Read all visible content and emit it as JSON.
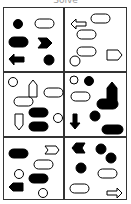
{
  "title": "Solve",
  "panels": [
    {
      "id": "top-left",
      "shapes": [
        "filled-circle",
        "outlined-rounded-rect",
        "filled-rounded-rect",
        "filled-chevron",
        "filled-arrow-left",
        "filled-circle"
      ]
    },
    {
      "id": "top-right",
      "shapes": [
        "outlined-arrow-left",
        "outlined-rounded-rect",
        "outlined-rounded-rect",
        "outlined-rounded-rect",
        "outlined-pentagon-right",
        "outlined-circle"
      ]
    },
    {
      "id": "middle-left",
      "shapes": [
        "outlined-circle",
        "outlined-pentagon-up",
        "outlined-rounded-rect",
        "outlined-rounded-rect",
        "outlined-pentagon-down",
        "filled-rounded-rect",
        "filled-rounded-rect",
        "outlined-circle"
      ]
    },
    {
      "id": "middle-right",
      "shapes": [
        "outlined-circle",
        "filled-circle",
        "filled-pentagon-up",
        "outlined-rounded-rect",
        "filled-rounded-rect",
        "filled-arrow-down",
        "filled-circle",
        "filled-rounded-rect"
      ]
    },
    {
      "id": "bottom-left",
      "shapes": [
        "filled-rounded-rect",
        "outlined-chevron",
        "outlined-rounded-rect",
        "outlined-circle",
        "filled-rounded-rect",
        "filled-pentagon-left",
        "outlined-circle"
      ]
    },
    {
      "id": "bottom-right",
      "shapes": [
        "filled-chevron-left",
        "filled-circle",
        "filled-circle",
        "filled-circle",
        "outlined-rounded-rect",
        "outlined-rounded-rect",
        "outlined-arrow-right"
      ]
    }
  ],
  "colors": {
    "ink": "#000000",
    "frame": "#333333",
    "title": "#9a9a9a"
  }
}
